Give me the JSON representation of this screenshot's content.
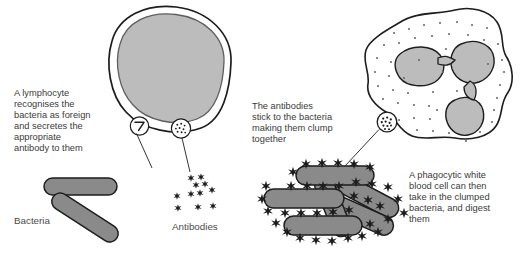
{
  "diagram": {
    "colors": {
      "nucleus_gray": "#bcbcbc",
      "bacteria_gray": "#8a8a8a",
      "outline": "#1d1d1d",
      "text": "#3b3b3b",
      "background": "#ffffff"
    },
    "captions": {
      "lymphocyte": {
        "lines": [
          "A lymphocyte",
          "recognises the",
          "bacteria as foreign",
          "and secretes the",
          "appropriate",
          "antibody to them"
        ]
      },
      "antibodies_stick": {
        "lines": [
          "The antibodies",
          "stick to the bacteria",
          "making them clump",
          "together"
        ]
      },
      "phagocyte": {
        "lines": [
          "A phagocytic white",
          "blood cell can then",
          "take in the clumped",
          "bacteria, and digest",
          "them"
        ]
      }
    },
    "labels": {
      "bacteria": "Bacteria",
      "antibodies": "Antibodies"
    },
    "insets": {
      "antibody_symbol": "antibody-y-shape",
      "antibody_cluster": "antibody-cluster-dots",
      "clumped_marker": "clumped-antibody-mass"
    }
  }
}
